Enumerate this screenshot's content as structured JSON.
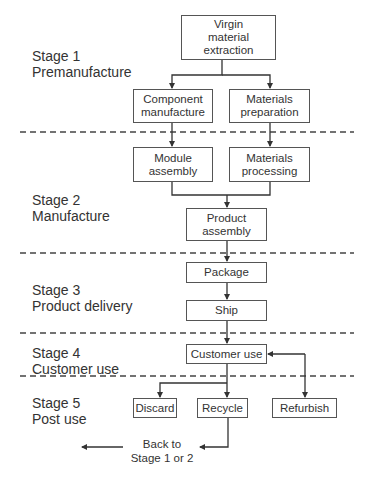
{
  "stages": [
    {
      "label": "Stage 1\nPremanufacture"
    },
    {
      "label": "Stage 2\nManufacture"
    },
    {
      "label": "Stage 3\nProduct delivery"
    },
    {
      "label": "Stage 4\nCustomer use"
    },
    {
      "label": "Stage 5\nPost use"
    }
  ],
  "nodes": {
    "virgin": "Virgin\nmaterial\nextraction",
    "component": "Component\nmanufacture",
    "mat_prep": "Materials\npreparation",
    "module": "Module\nassembly",
    "mat_proc": "Materials\nprocessing",
    "product": "Product\nassembly",
    "package": "Package",
    "ship": "Ship",
    "customer": "Customer use",
    "discard": "Discard",
    "recycle": "Recycle",
    "refurbish": "Refurbish"
  },
  "notes": {
    "back": "Back to\nStage 1 or 2"
  },
  "colors": {
    "line": "#333333",
    "box_border": "#555555"
  }
}
